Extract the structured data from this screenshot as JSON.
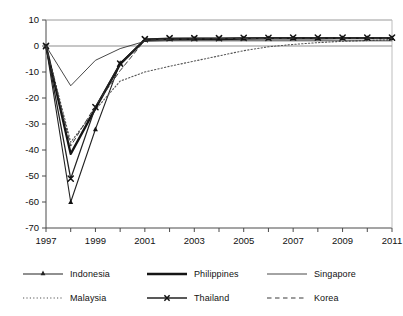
{
  "chart_data": {
    "type": "line",
    "title": "",
    "subtitle": "",
    "xlabel": "",
    "ylabel": "",
    "x": [
      1997,
      1998,
      1999,
      2000,
      2001,
      2002,
      2003,
      2004,
      2005,
      2006,
      2007,
      2008,
      2009,
      2010,
      2011
    ],
    "xlim": [
      1997,
      2011
    ],
    "ylim": [
      -70,
      10
    ],
    "yticks": [
      10,
      0,
      -10,
      -20,
      -30,
      -40,
      -50,
      -60,
      -70
    ],
    "xticks": [
      1997,
      1999,
      2001,
      2003,
      2005,
      2007,
      2009,
      2011
    ],
    "xtick_labels": [
      "1997",
      "1999",
      "2001",
      "2003",
      "2005",
      "2007",
      "2009",
      "2011"
    ],
    "ytick_labels": [
      "10",
      "0",
      "-10",
      "-20",
      "-30",
      "-40",
      "-50",
      "-60",
      "-70"
    ],
    "grid": false,
    "zero_line": true,
    "legend_position": "bottom",
    "series": [
      {
        "name": "Indonesia",
        "style": "solid-thin-marker",
        "marker": "triangle",
        "color": "#222222",
        "width": 1.1,
        "values": [
          0,
          -60,
          -32,
          -6.5,
          2.3,
          2.7,
          2.8,
          2.8,
          2.9,
          3.0,
          3.0,
          3.0,
          3.1,
          3.1,
          3.1
        ]
      },
      {
        "name": "Malaysia",
        "style": "dotted",
        "marker": "none",
        "color": "#555555",
        "width": 1.1,
        "values": [
          0,
          -37,
          -24.5,
          -13.5,
          -10.0,
          -7.8,
          -5.8,
          -3.8,
          -1.8,
          -0.3,
          0.6,
          1.3,
          1.8,
          2.1,
          2.4
        ]
      },
      {
        "name": "Philippines",
        "style": "solid-thick",
        "marker": "none",
        "color": "#151515",
        "width": 2.3,
        "values": [
          0,
          -41.5,
          -24,
          -7,
          2.4,
          2.6,
          2.7,
          2.7,
          2.8,
          2.9,
          2.9,
          2.9,
          3.0,
          3.0,
          3.0
        ]
      },
      {
        "name": "Thailand",
        "style": "solid-marker",
        "marker": "x",
        "color": "#222222",
        "width": 1.3,
        "values": [
          0,
          -51,
          -23.5,
          -6.8,
          2.6,
          3.0,
          3.0,
          3.0,
          3.1,
          3.1,
          3.2,
          3.2,
          3.2,
          3.2,
          3.2
        ]
      },
      {
        "name": "Singapore",
        "style": "solid-hairline",
        "marker": "none",
        "color": "#333333",
        "width": 0.9,
        "values": [
          0,
          -15.3,
          -5.5,
          -1.0,
          1.8,
          2.0,
          2.0,
          2.0,
          2.0,
          2.0,
          2.0,
          2.0,
          2.0,
          2.0,
          2.0
        ]
      },
      {
        "name": "Korea",
        "style": "dashed",
        "marker": "none",
        "color": "#3a3a3a",
        "width": 1.0,
        "values": [
          0,
          -38.5,
          -23,
          -9.5,
          2.2,
          2.6,
          2.7,
          2.8,
          2.9,
          2.9,
          3.0,
          3.0,
          3.0,
          3.0,
          3.0
        ]
      }
    ]
  },
  "legend": {
    "items": [
      {
        "label": "Indonesia",
        "sample": "line-triangle-marker"
      },
      {
        "label": "Philippines",
        "sample": "line-thick"
      },
      {
        "label": "Singapore",
        "sample": "line-thin"
      },
      {
        "label": "Malaysia",
        "sample": "line-dotted"
      },
      {
        "label": "Thailand",
        "sample": "line-x-marker"
      },
      {
        "label": "Korea",
        "sample": "line-dashed"
      }
    ]
  }
}
